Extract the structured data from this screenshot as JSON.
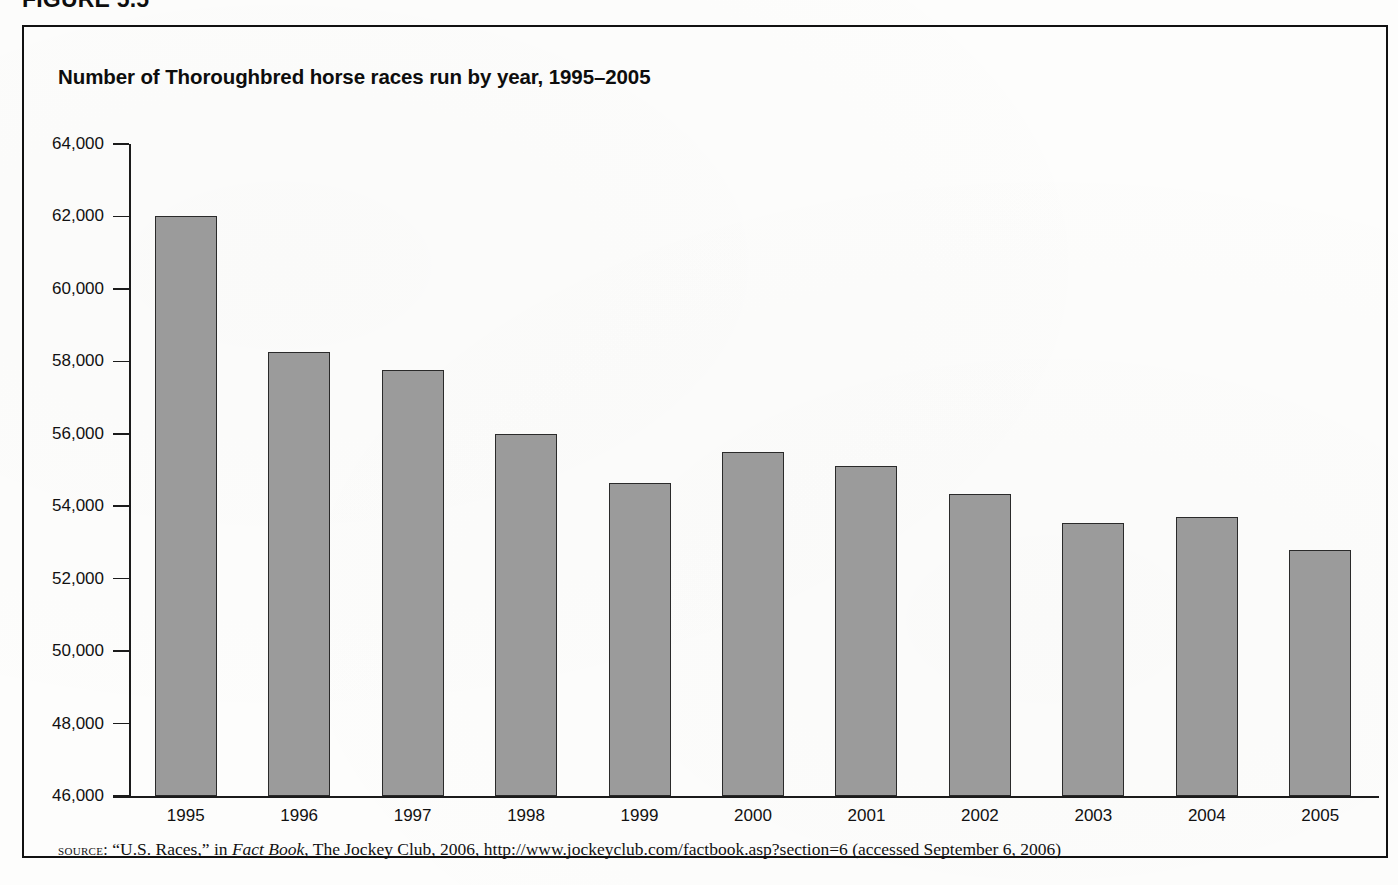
{
  "figure": {
    "heading": "FIGURE 5.5",
    "title": "Number of Thoroughbred horse races run by year, 1995–2005"
  },
  "source": {
    "label": "source:",
    "part1": " “U.S. Races,” in ",
    "italic": "Fact Book",
    "part2": ", The Jockey Club, 2006, http://www.jockeyclub.com/factbook.asp?section=6 (accessed September 6, 2006)"
  },
  "colors": {
    "bar_fill": "#9b9b9b",
    "bar_outline": "#2a2a2a",
    "frame": "#111111",
    "text": "#111111",
    "page_background": "#fdfdfc"
  },
  "chart_data": {
    "type": "bar",
    "title": "Number of Thoroughbred horse races run by year, 1995–2005",
    "xlabel": "",
    "ylabel": "",
    "ylim": [
      46000,
      64000
    ],
    "ytick_step": 2000,
    "ytick_labels": [
      "64,000",
      "62,000",
      "60,000",
      "58,000",
      "56,000",
      "54,000",
      "52,000",
      "50,000",
      "48,000",
      "46,000"
    ],
    "ytick_values": [
      64000,
      62000,
      60000,
      58000,
      56000,
      54000,
      52000,
      50000,
      48000,
      46000
    ],
    "grid": false,
    "legend": false,
    "categories": [
      "1995",
      "1996",
      "1997",
      "1998",
      "1999",
      "2000",
      "2001",
      "2002",
      "2003",
      "2004",
      "2005"
    ],
    "values": [
      62000,
      58250,
      57750,
      56000,
      54640,
      55500,
      55120,
      54330,
      53540,
      53700,
      52780
    ]
  }
}
